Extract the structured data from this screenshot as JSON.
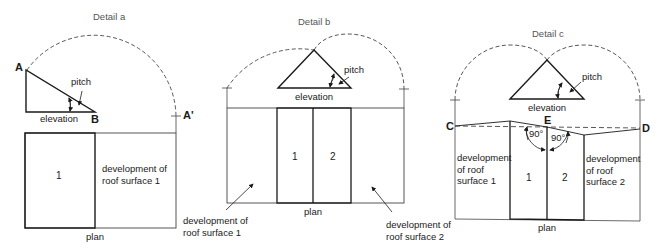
{
  "figure": {
    "detail_a": {
      "title": "Detail a",
      "point_a": "A",
      "point_b": "B",
      "point_a_prime": "A'",
      "pitch_label": "pitch",
      "elevation_label": "elevation",
      "surface_number": "1",
      "development_label": "development of\nroof surface 1",
      "plan_label": "plan"
    },
    "detail_b": {
      "title": "Detail b",
      "pitch_label": "pitch",
      "elevation_label": "elevation",
      "surface_numbers": [
        "1",
        "2"
      ],
      "plan_label": "plan",
      "development_1_label": "development of\nroof surface 1",
      "development_2_label": "development of\nroof surface 2"
    },
    "detail_c": {
      "title": "Detail c",
      "pitch_label": "pitch",
      "elevation_label": "elevation",
      "point_c": "C",
      "point_d": "D",
      "point_e": "E",
      "angle_left": "90°",
      "angle_right": "90°",
      "surface_numbers": [
        "1",
        "2"
      ],
      "development_1_label": "development\nof roof\nsurface 1",
      "development_2_label": "development\nof roof\nsurface 2",
      "plan_label": "plan"
    }
  },
  "colors": {
    "line": "#1a1a1a",
    "thin_line": "#444444",
    "title_text": "#555555"
  }
}
